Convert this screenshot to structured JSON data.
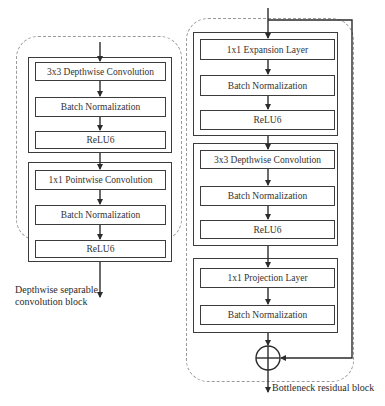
{
  "diagram": {
    "type": "neural-network-block-comparison",
    "colors": {
      "line": "#3c3c3c",
      "dashed": "#9a9a9a",
      "text": "#2b2b2b",
      "background": "#ffffff"
    }
  },
  "left_block": {
    "caption_line1": "Depthwise separable",
    "caption_line2": "convolution block",
    "groups": [
      {
        "layers": [
          {
            "label": "3x3 Depthwise Convolution"
          },
          {
            "label": "Batch Normalization"
          },
          {
            "label": "ReLU6"
          }
        ]
      },
      {
        "layers": [
          {
            "label": "1x1 Pointwise Convolution"
          },
          {
            "label": "Batch Normalization"
          },
          {
            "label": "ReLU6"
          }
        ]
      }
    ]
  },
  "right_block": {
    "caption": "Bottleneck residual block",
    "add_symbol": "⊕",
    "groups": [
      {
        "layers": [
          {
            "label": "1x1 Expansion Layer"
          },
          {
            "label": "Batch Normalization"
          },
          {
            "label": "ReLU6"
          }
        ]
      },
      {
        "layers": [
          {
            "label": "3x3 Depthwise Convolution"
          },
          {
            "label": "Batch Normalization"
          },
          {
            "label": "ReLU6"
          }
        ]
      },
      {
        "layers": [
          {
            "label": "1x1 Projection Layer"
          },
          {
            "label": "Batch Normalization"
          }
        ]
      }
    ]
  }
}
